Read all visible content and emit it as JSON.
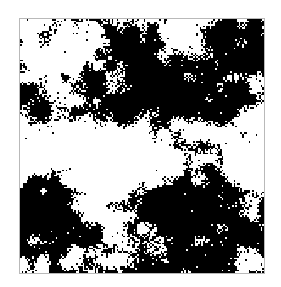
{
  "figure": {
    "kind": "binary-lattice-configuration",
    "canvas_width": 281,
    "canvas_height": 287,
    "background_color": "#ffffff",
    "title": "",
    "caption": ""
  },
  "panel": {
    "left": 19,
    "top": 18,
    "width": 244,
    "height": 254,
    "border_width": 1,
    "border_color": "#b9b9b9",
    "fill_color": "#ffffff"
  },
  "chart_data": {
    "type": "heatmap",
    "title": "",
    "subtitle": "",
    "xlabel": "",
    "ylabel": "",
    "grid": false,
    "legend": "none",
    "colormap": [
      "#ffffff",
      "#000000"
    ],
    "value_labels": [
      "white",
      "black"
    ],
    "lattice_cols": 144,
    "lattice_height_rows": 150,
    "cell_size_px": 1.7,
    "black_fraction": 0.52,
    "white_fraction": 0.48,
    "xlim": [
      0,
      144
    ],
    "ylim": [
      0,
      150
    ],
    "noise_model": {
      "random_seed": 20240517,
      "octaves": [
        {
          "scale": 0.045,
          "weight": 1.0
        },
        {
          "scale": 0.09,
          "weight": 0.55
        },
        {
          "scale": 0.19,
          "weight": 0.3
        },
        {
          "scale": 0.42,
          "weight": 0.17
        },
        {
          "scale": 0.95,
          "weight": 0.34
        }
      ],
      "threshold_base": 0.02,
      "speckle_probability": 0.1,
      "edge_roughness": 0.38
    },
    "domains": [
      {
        "name": "upper-left-white-region",
        "cx": 0.17,
        "cy": 0.12,
        "rx": 0.22,
        "ry": 0.14,
        "state": "white",
        "strength": 0.72
      },
      {
        "name": "top-center-black-band",
        "cx": 0.46,
        "cy": 0.14,
        "rx": 0.17,
        "ry": 0.11,
        "state": "black",
        "strength": 0.78
      },
      {
        "name": "upper-right-black-corner",
        "cx": 0.88,
        "cy": 0.1,
        "rx": 0.16,
        "ry": 0.12,
        "state": "black",
        "strength": 0.8
      },
      {
        "name": "top-right-white-notch",
        "cx": 0.7,
        "cy": 0.08,
        "rx": 0.1,
        "ry": 0.08,
        "state": "white",
        "strength": 0.6
      },
      {
        "name": "central-black-mass",
        "cx": 0.44,
        "cy": 0.3,
        "rx": 0.26,
        "ry": 0.14,
        "state": "black",
        "strength": 0.85
      },
      {
        "name": "right-black-spine",
        "cx": 0.8,
        "cy": 0.33,
        "rx": 0.14,
        "ry": 0.18,
        "state": "black",
        "strength": 0.76
      },
      {
        "name": "left-edge-black-arm",
        "cx": 0.04,
        "cy": 0.33,
        "rx": 0.1,
        "ry": 0.13,
        "state": "black",
        "strength": 0.7
      },
      {
        "name": "mid-right-white-bay",
        "cx": 0.93,
        "cy": 0.52,
        "rx": 0.12,
        "ry": 0.12,
        "state": "white",
        "strength": 0.68
      },
      {
        "name": "central-white-channel",
        "cx": 0.36,
        "cy": 0.52,
        "rx": 0.26,
        "ry": 0.12,
        "state": "white",
        "strength": 0.8
      },
      {
        "name": "left-mid-white-region",
        "cx": 0.12,
        "cy": 0.5,
        "rx": 0.14,
        "ry": 0.12,
        "state": "white",
        "strength": 0.62
      },
      {
        "name": "bottom-right-black-mass",
        "cx": 0.68,
        "cy": 0.78,
        "rx": 0.3,
        "ry": 0.22,
        "state": "black",
        "strength": 0.92
      },
      {
        "name": "bottom-left-black-block",
        "cx": 0.09,
        "cy": 0.76,
        "rx": 0.15,
        "ry": 0.17,
        "state": "black",
        "strength": 0.8
      },
      {
        "name": "lower-center-white-gap",
        "cx": 0.36,
        "cy": 0.7,
        "rx": 0.14,
        "ry": 0.12,
        "state": "white",
        "strength": 0.62
      },
      {
        "name": "bottom-center-white-wedge",
        "cx": 0.3,
        "cy": 0.95,
        "rx": 0.12,
        "ry": 0.09,
        "state": "white",
        "strength": 0.5
      },
      {
        "name": "right-edge-white-pocket",
        "cx": 0.97,
        "cy": 0.72,
        "rx": 0.07,
        "ry": 0.07,
        "state": "white",
        "strength": 0.45
      },
      {
        "name": "bottom-edge-black-band",
        "cx": 0.55,
        "cy": 0.99,
        "rx": 0.3,
        "ry": 0.07,
        "state": "black",
        "strength": 0.62
      }
    ]
  }
}
